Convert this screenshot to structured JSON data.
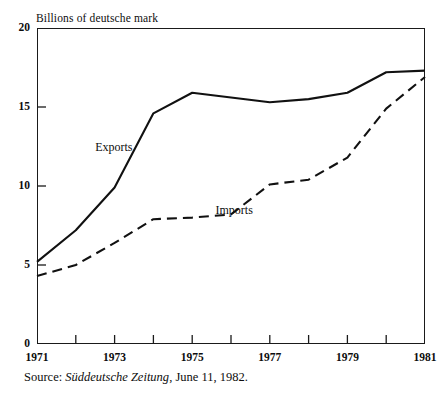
{
  "figure": {
    "y_axis_caption": "Billions of deutsche mark",
    "source_prefix": "Source:",
    "source_journal": "Süddeutsche Zeitung",
    "source_rest": ", June 11, 1982."
  },
  "chart_data": {
    "type": "line",
    "title": "",
    "subtitle": "",
    "xlabel": "",
    "ylabel": "Billions of deutsche mark",
    "xlim": [
      1971,
      1981
    ],
    "ylim": [
      0,
      20
    ],
    "grid": false,
    "legend_position": "inline-annotation",
    "y_ticks": [
      0,
      5,
      10,
      15,
      20
    ],
    "y_tick_labels": [
      "0",
      "5",
      "10",
      "15",
      "20"
    ],
    "x_ticks": [
      1971,
      1972,
      1973,
      1974,
      1975,
      1976,
      1977,
      1978,
      1979,
      1980,
      1981
    ],
    "x_tick_labels_shown": [
      "1971",
      "1973",
      "1975",
      "1977",
      "1979",
      "1981"
    ],
    "x": [
      1971,
      1972,
      1973,
      1974,
      1975,
      1976,
      1977,
      1978,
      1979,
      1980,
      1981
    ],
    "series": [
      {
        "name": "Exports",
        "style": "solid",
        "color": "#111111",
        "values": [
          5.2,
          7.2,
          9.9,
          14.6,
          15.9,
          15.6,
          15.3,
          15.5,
          15.9,
          17.2,
          17.3
        ]
      },
      {
        "name": "Imports",
        "style": "dashed",
        "color": "#111111",
        "values": [
          4.3,
          5.0,
          6.4,
          7.9,
          8.0,
          8.2,
          10.1,
          10.4,
          11.8,
          14.9,
          16.9
        ]
      }
    ],
    "annotations": [
      {
        "text": "Exports",
        "x": 1972.5,
        "y": 12.4
      },
      {
        "text": "Imports",
        "x": 1975.6,
        "y": 8.4
      }
    ]
  }
}
